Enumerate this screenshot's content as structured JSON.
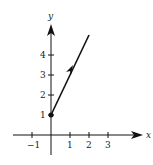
{
  "diagram": {
    "type": "vector-on-coordinate-plane",
    "axes": {
      "x_label": "x",
      "y_label": "y",
      "x_ticks": [
        {
          "value": -1,
          "label": "−1"
        },
        {
          "value": 1,
          "label": "1"
        },
        {
          "value": 2,
          "label": "2"
        },
        {
          "value": 3,
          "label": "3"
        }
      ],
      "y_ticks": [
        {
          "value": 1,
          "label": "1"
        },
        {
          "value": 2,
          "label": "2"
        },
        {
          "value": 3,
          "label": "3"
        },
        {
          "value": 4,
          "label": "4"
        }
      ]
    },
    "ray": {
      "start_point": [
        0,
        1
      ],
      "through_point": [
        2,
        5
      ],
      "start_marker": "filled-dot",
      "direction_arrow": "midway arrowhead",
      "color": "#111111"
    }
  }
}
